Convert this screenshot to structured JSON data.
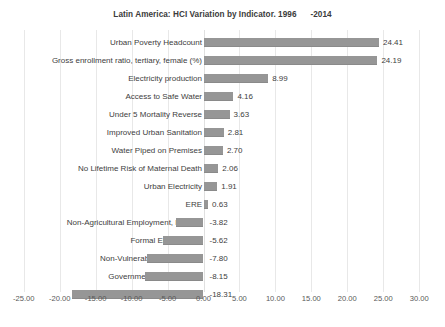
{
  "chart_data": {
    "type": "bar",
    "orientation": "horizontal",
    "title": "Latin America: HCI Variation by Indicator. 1996      -2014",
    "xlabel": "",
    "ylabel": "",
    "xlim": [
      -25.0,
      30.0
    ],
    "xtick_step": 5.0,
    "grid": true,
    "legend": null,
    "bar_color": "#969696",
    "gridline_color": "#e8e8e8",
    "categories": [
      "Urban Poverty Headcount",
      "Gross enrollment ratio, tertiary, female (%)",
      "Electricity production",
      "Access to Safe Water",
      "Under 5 Mortality Reverse",
      "Improved Urban Sanitation",
      "Water Piped on Premises",
      "No Lifetime Risk of Maternal Death",
      "Urban Electricity",
      "ERE",
      "Non-Agricultural Employment, Female",
      "Formal Employment",
      "Non-Vulnerable Employment",
      "Government Effectiveness",
      "Quality of Government"
    ],
    "values": [
      24.41,
      24.19,
      8.99,
      4.16,
      3.63,
      2.81,
      2.7,
      2.06,
      1.91,
      0.63,
      -3.82,
      -5.62,
      -7.8,
      -8.15,
      -18.31
    ],
    "data_labels": [
      "24.41",
      "24.19",
      "8.99",
      "4.16",
      "3.63",
      "2.81",
      "2.70",
      "2.06",
      "1.91",
      "0.63",
      "-3.82",
      "-5.62",
      "-7.80",
      "-8.15",
      "-18.31"
    ],
    "xtick_labels": [
      "-25.00",
      "-20.00",
      "-15.00",
      "-10.00",
      "-5.00",
      "0.00",
      "5.00",
      "10.00",
      "15.00",
      "20.00",
      "25.00",
      "30.00"
    ],
    "xtick_values": [
      -25,
      -20,
      -15,
      -10,
      -5,
      0,
      5,
      10,
      15,
      20,
      25,
      30
    ]
  }
}
